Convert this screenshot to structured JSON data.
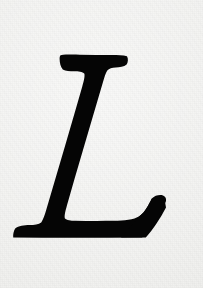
{
  "document": {
    "kind": "scanned-glyph-specimen",
    "width": 203,
    "height": 288,
    "character": "L",
    "character_name": "latin-capital-letter-l",
    "style": "italic serif",
    "ink_color": "#050505",
    "paper_color": "#f2f2f0",
    "alt_text": "Italic serif capital letter L printed in black ink on off-white paper"
  },
  "glyph": {
    "label": "L",
    "baseline_y": 238,
    "cap_top_y": 55,
    "left_extent_x": 13,
    "right_extent_x": 166,
    "slant_direction": "down-left",
    "features": [
      "top-serif-bar",
      "oblique-stem",
      "baseline-bar",
      "left-foot-serif",
      "right-upturned-terminal"
    ],
    "path": "M 60.5 55.2 C 66.0 54.4 73.5 54.6 80.0 54.7 C 90.5 54.9 101.5 55.0 112.0 55.0 C 117.5 55.0 123.0 55.0 127.0 56.2 C 128.4 58.6 128.1 62.4 126.6 64.6 C 124.1 67.0 119.4 67.3 115.6 67.6 C 112.2 67.9 109.0 68.4 107.3 70.6 C 105.6 73.4 104.3 77.6 103.0 82.0 C 96.4 104.6 89.6 127.4 83.0 150.0 C 77.6 168.4 72.2 186.8 67.0 205.2 C 65.6 210.2 64.2 215.4 64.8 218.2 C 66.6 220.4 71.0 220.6 75.0 220.7 C 88.0 221.0 101.2 221.0 114.2 220.8 C 124.0 220.6 133.6 220.0 139.6 216.0 C 145.4 212.0 148.6 205.0 151.8 198.6 C 153.8 204.2 155.8 209.8 157.8 215.4 C 160.0 210.4 162.2 205.4 164.4 200.4 C 165.1 202.8 165.8 205.2 166.0 207.4 C 163.0 213.0 159.8 218.6 156.2 224.0 C 153.0 228.8 149.6 233.4 145.8 237.4 C 121.0 237.6 96.2 237.7 71.4 237.7 C 52.0 237.7 32.6 237.6 13.2 237.4 C 13.0 234.2 13.6 230.6 15.2 228.4 C 18.6 225.8 24.2 225.4 29.4 225.1 C 34.2 224.8 38.8 224.4 41.2 222.4 C 43.4 219.4 44.8 214.6 46.2 210.0 C 52.8 187.4 59.6 164.6 66.2 142.0 C 71.6 123.6 77.0 105.2 82.2 86.8 C 83.6 81.8 85.0 76.6 84.4 73.8 C 82.6 71.6 78.2 71.4 74.2 71.3 C 70.0 71.2 65.6 71.0 62.8 69.4 C 60.6 67.0 59.6 62.8 59.6 58.8 C 59.6 57.4 59.9 56.0 60.5 55.2 Z",
    "terminal_path": "M 139.6 216.0 C 145.4 212.0 148.6 205.0 151.8 198.6 C 155.0 195.4 159.2 194.6 163.0 195.4 C 165.6 196.4 166.4 198.6 166.0 201.0 C 163.2 209.2 159.4 217.4 154.6 224.6 C 151.0 230.2 146.8 235.0 142.0 237.5 C 135.0 237.6 128.0 237.6 121.0 237.6 C 126.6 231.0 133.2 223.6 139.6 216.0 Z"
  }
}
